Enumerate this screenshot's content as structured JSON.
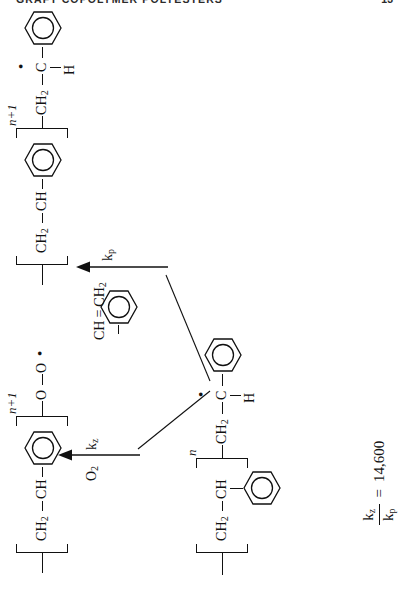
{
  "page": {
    "running_head": "GRAFT COPOLYMER POLYESTERS",
    "page_number": "13"
  },
  "scheme": {
    "reactant": {
      "name": "polystyryl-radical",
      "head_h": "H",
      "head_c": "C",
      "radical_dot": "•",
      "ch2_upper": "CH",
      "ch2_upper_sub": "2",
      "repeat_ch": "CH",
      "repeat_ch2": "CH",
      "repeat_ch2_sub": "2",
      "repeat_index": "n",
      "ring": "phenyl-ring"
    },
    "branch_oxidation": {
      "name": "oxidation-branch",
      "reagent": "O",
      "reagent_sub": "2",
      "rate_constant": "k",
      "rate_constant_sub": "z",
      "arrow": "up-arrow"
    },
    "branch_propagation": {
      "name": "propagation-branch",
      "reagent_ch": "CH",
      "reagent_double_bond": "=",
      "reagent_ch2": "CH",
      "reagent_ch2_sub": "2",
      "rate_constant": "k",
      "rate_constant_sub": "p",
      "arrow": "up-arrow"
    },
    "product_peroxy": {
      "name": "peroxy-radical-product",
      "o_inner": "O",
      "o_outer": "O",
      "radical_dot": "•",
      "repeat_ch": "CH",
      "repeat_ch2": "CH",
      "repeat_ch2_sub": "2",
      "repeat_index": "n+1",
      "ring": "phenyl-ring"
    },
    "product_chain": {
      "name": "extended-polystyryl-radical-product",
      "head_h": "H",
      "head_c": "C",
      "radical_dot": "•",
      "ch2_upper": "CH",
      "ch2_upper_sub": "2",
      "repeat_ch": "CH",
      "repeat_ch2": "CH",
      "repeat_ch2_sub": "2",
      "repeat_index": "n+1",
      "ring": "phenyl-ring"
    }
  },
  "ratio_equation": {
    "name": "rate-constant-ratio",
    "numerator": "k",
    "numerator_sub": "z",
    "denominator": "k",
    "denominator_sub": "p",
    "equals": "=",
    "value": "14,600"
  },
  "colors": {
    "ink": "#111111",
    "paper": "#ffffff",
    "head": "#2b2b2b"
  }
}
